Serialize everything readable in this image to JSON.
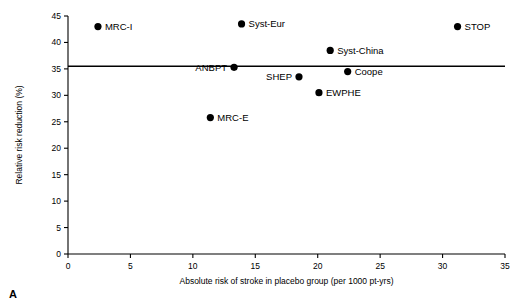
{
  "panel": {
    "letter": "A"
  },
  "chart_data": {
    "type": "scatter",
    "title": "",
    "xlabel": "Absolute risk of stroke in placebo group (per 1000 pt-yrs)",
    "ylabel": "Relative risk reduction (%)",
    "xlim": [
      0,
      35
    ],
    "ylim": [
      0,
      45
    ],
    "xticks": [
      0,
      5,
      10,
      15,
      20,
      25,
      30,
      35
    ],
    "yticks": [
      0,
      5,
      10,
      15,
      20,
      25,
      30,
      35,
      40,
      45
    ],
    "grid": false,
    "legend": "none",
    "reference_line": {
      "orientation": "horizontal",
      "y": 35.5,
      "label": ""
    },
    "points": [
      {
        "label": "MRC-I",
        "x": 2.4,
        "y": 43.0,
        "label_position": "right"
      },
      {
        "label": "Syst-Eur",
        "x": 13.9,
        "y": 43.5,
        "label_position": "right"
      },
      {
        "label": "STOP",
        "x": 31.2,
        "y": 43.0,
        "label_position": "right"
      },
      {
        "label": "Syst-China",
        "x": 21.0,
        "y": 38.5,
        "label_position": "right"
      },
      {
        "label": "ANBPT",
        "x": 13.3,
        "y": 35.3,
        "label_position": "left"
      },
      {
        "label": "Coope",
        "x": 22.4,
        "y": 34.5,
        "label_position": "right"
      },
      {
        "label": "SHEP",
        "x": 18.5,
        "y": 33.5,
        "label_position": "left"
      },
      {
        "label": "EWPHE",
        "x": 20.1,
        "y": 30.5,
        "label_position": "right"
      },
      {
        "label": "MRC-E",
        "x": 11.4,
        "y": 25.8,
        "label_position": "right"
      }
    ]
  }
}
